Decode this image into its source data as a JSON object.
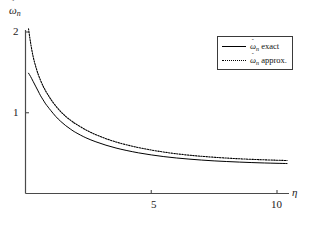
{
  "chart_data": {
    "type": "line",
    "title": "",
    "xlabel": "η",
    "ylabel": "ω̃n",
    "xlim": [
      0,
      10.6
    ],
    "ylim": [
      0,
      2.12
    ],
    "xticks": [
      5,
      10
    ],
    "xtick_labels": [
      "5",
      "10"
    ],
    "yticks": [
      1,
      2
    ],
    "ytick_labels": [
      "1",
      "2"
    ],
    "grid": false,
    "legend_position": "upper-right",
    "series": [
      {
        "name": "ω̃n exact",
        "style": "solid",
        "color": "#000000",
        "x": [
          0.12,
          0.2,
          0.3,
          0.4,
          0.5,
          0.6,
          0.7,
          0.8,
          0.9,
          1.0,
          1.2,
          1.4,
          1.6,
          1.8,
          2.0,
          2.4,
          2.8,
          3.2,
          3.6,
          4.0,
          4.5,
          5.0,
          5.5,
          6.0,
          6.5,
          7.0,
          7.5,
          8.0,
          8.5,
          9.0,
          9.5,
          10.0,
          10.4
        ],
        "y": [
          1.49,
          1.45,
          1.39,
          1.33,
          1.27,
          1.21,
          1.16,
          1.11,
          1.07,
          1.03,
          0.955,
          0.893,
          0.84,
          0.795,
          0.755,
          0.69,
          0.64,
          0.598,
          0.563,
          0.534,
          0.503,
          0.478,
          0.457,
          0.44,
          0.426,
          0.414,
          0.404,
          0.396,
          0.389,
          0.383,
          0.378,
          0.374,
          0.371
        ]
      },
      {
        "name": "ω̃n approx.",
        "style": "dotted",
        "color": "#000000",
        "x": [
          0.12,
          0.2,
          0.3,
          0.4,
          0.5,
          0.6,
          0.7,
          0.8,
          0.9,
          1.0,
          1.2,
          1.4,
          1.6,
          1.8,
          2.0,
          2.4,
          2.8,
          3.2,
          3.6,
          4.0,
          4.5,
          5.0,
          5.5,
          6.0,
          6.5,
          7.0,
          7.5,
          8.0,
          8.5,
          9.0,
          9.5,
          10.0,
          10.4
        ],
        "y": [
          2.04,
          1.87,
          1.7,
          1.58,
          1.48,
          1.4,
          1.33,
          1.27,
          1.22,
          1.17,
          1.085,
          1.015,
          0.955,
          0.905,
          0.862,
          0.788,
          0.728,
          0.679,
          0.638,
          0.604,
          0.568,
          0.538,
          0.513,
          0.492,
          0.475,
          0.461,
          0.449,
          0.439,
          0.43,
          0.423,
          0.417,
          0.412,
          0.408
        ]
      }
    ],
    "annotations": []
  },
  "axes": {
    "ylabel_text": "ω",
    "ylabel_tilde": "˜",
    "ylabel_sub": "n",
    "xlabel_text": "η",
    "ytick_2": "2",
    "ytick_1": "1",
    "xtick_5": "5",
    "xtick_10": "10"
  },
  "legend": {
    "items": [
      {
        "symbol": "ω",
        "tilde": "˜",
        "sub": "n",
        "label": " exact",
        "style": "solid"
      },
      {
        "symbol": "ω",
        "tilde": "˜",
        "sub": "n",
        "label": " approx.",
        "style": "dotted"
      }
    ]
  }
}
